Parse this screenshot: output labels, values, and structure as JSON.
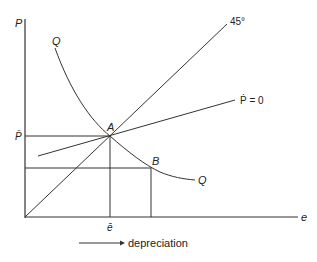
{
  "diagram": {
    "axes": {
      "y_label": "P",
      "x_label": "e"
    },
    "curve_label_top": "Q",
    "curve_label_bottom": "Q",
    "line_45_label": "45°",
    "pdot_label": "Ṗ = 0",
    "point_a": "A",
    "point_b": "B",
    "p_bar_label": "P̄",
    "e_bar_label": "ē",
    "arrow_label": "depreciation"
  },
  "colors": {
    "line": "#333333",
    "background": "#ffffff"
  }
}
